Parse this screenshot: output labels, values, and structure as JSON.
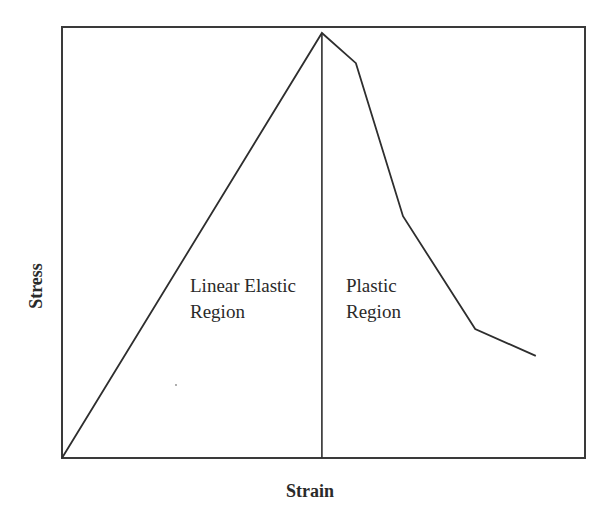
{
  "chart_data": {
    "type": "line",
    "title": "",
    "xlabel": "Strain",
    "ylabel": "Stress",
    "xlim": [
      0,
      100
    ],
    "ylim": [
      0,
      100
    ],
    "grid": false,
    "legend": null,
    "ticks": "none",
    "series": [
      {
        "name": "Stress-strain curve",
        "x": [
          0,
          49.7,
          56.2,
          65.2,
          79.0,
          90.6
        ],
        "y": [
          0,
          98.6,
          91.6,
          56.1,
          29.9,
          23.7
        ]
      }
    ],
    "annotations": [
      {
        "type": "vline",
        "x": 49.7,
        "from_y": 0,
        "to_y": 98.6
      },
      {
        "type": "text",
        "lines": [
          "Linear Elastic",
          "Region"
        ],
        "x": 24,
        "y": 41
      },
      {
        "type": "text",
        "lines": [
          "Plastic",
          "Region"
        ],
        "x": 53,
        "y": 41
      }
    ]
  },
  "labels": {
    "xlabel": "Strain",
    "ylabel": "Stress",
    "elastic_line1": "Linear Elastic",
    "elastic_line2": "Region",
    "plastic_line1": "Plastic",
    "plastic_line2": "Region"
  },
  "layout": {
    "plot_px": {
      "left": 62,
      "top": 27,
      "right": 585,
      "bottom": 458
    },
    "line_color": "#2e2e2e",
    "frame_color": "#3a3a3a",
    "background": "#ffffff"
  }
}
